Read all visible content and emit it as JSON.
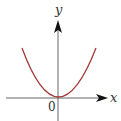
{
  "diagram": {
    "title": "",
    "curve": {
      "type": "parabola",
      "equation_hint": "y = x^2",
      "color": "#a33a3a"
    },
    "axes": {
      "x_label": "x",
      "y_label": "y",
      "origin_label": "0",
      "axis_color": "#555555"
    }
  }
}
